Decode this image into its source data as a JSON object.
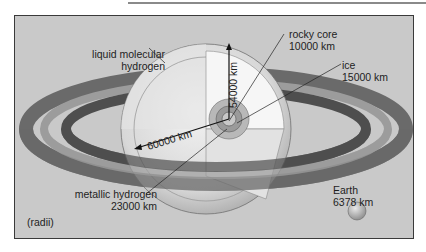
{
  "diagram": {
    "note": "(radii)",
    "labels": {
      "liquid_molecular_hydrogen_l1": "liquid molecular",
      "liquid_molecular_hydrogen_l2": "hydrogen",
      "rocky_core_name": "rocky core",
      "rocky_core_radius": "10000 km",
      "ice_name": "ice",
      "ice_radius": "15000 km",
      "metallic_hydrogen_name": "metallic hydrogen",
      "metallic_hydrogen_radius": "23000 km",
      "polar_radius": "54000 km",
      "equatorial_radius": "60000 km",
      "earth_name": "Earth",
      "earth_radius": "6378 km"
    },
    "colors": {
      "background": "#c9c9c9",
      "frame": "#3a3a3a",
      "ring_dark": "#5a5a5a",
      "ring_mid": "#8c8c8c",
      "planet_light": "#ededed",
      "text": "#1e1e1e"
    }
  }
}
